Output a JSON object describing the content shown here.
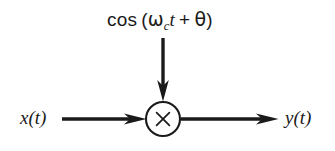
{
  "figure": {
    "name": "amplitude-modulator-block-diagram",
    "background_color": "#ffffff",
    "stroke_color": "#1a1a1a",
    "labels": {
      "carrier": {
        "text": "cos (ω_c t + θ)",
        "func": "cos",
        "open_paren": "(",
        "omega": "ω",
        "omega_subscript": "c",
        "time_var": "t",
        "plus": "+",
        "phase": "θ",
        "close_paren": ")"
      },
      "input": {
        "text": "x(t)",
        "var": "x",
        "open_paren": "(",
        "arg": "t",
        "close_paren": ")"
      },
      "output": {
        "text": "y(t)",
        "var": "y",
        "open_paren": "(",
        "arg": "t",
        "close_paren": ")"
      },
      "multiplier": {
        "symbol": "×",
        "role": "multiplier-node"
      }
    },
    "nodes": [
      {
        "id": "multiplier",
        "shape": "circle",
        "cx": 163,
        "cy": 119,
        "r": 17
      }
    ],
    "edges": [
      {
        "id": "input-edge",
        "from": "x(t)",
        "to": "multiplier",
        "direction": "right",
        "x1": 62,
        "y1": 119,
        "x2": 146,
        "y2": 119
      },
      {
        "id": "carrier-edge",
        "from": "cos (ω_c t + θ)",
        "to": "multiplier",
        "direction": "down",
        "x1": 163,
        "y1": 38,
        "x2": 163,
        "y2": 101
      },
      {
        "id": "output-edge",
        "from": "multiplier",
        "to": "y(t)",
        "direction": "right",
        "x1": 181,
        "y1": 119,
        "x2": 278,
        "y2": 119
      }
    ]
  }
}
